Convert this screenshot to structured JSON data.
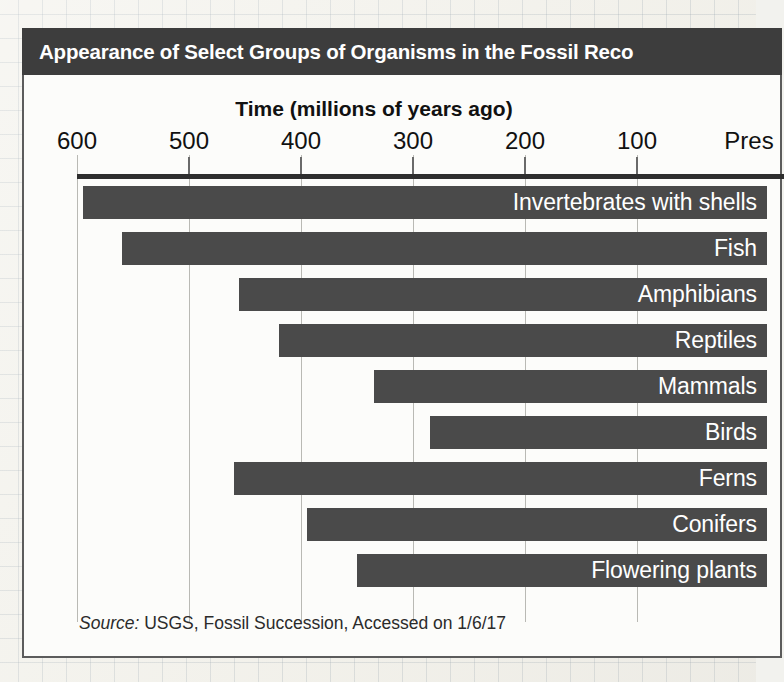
{
  "figure": {
    "title": "Appearance of Select Groups of Organisms in the Fossil Reco",
    "axis_title": "Time (millions of years ago)",
    "source_prefix": "Source:",
    "source_text": " USGS, Fossil Succession, Accessed on 1/6/17",
    "colors": {
      "title_bar": "#3d3d3d",
      "bar_fill": "#4a4a4a",
      "panel_bg": "#fcfcfa",
      "gridline": "#b9b9b4",
      "axis_line": "#2e2e2e",
      "label_text": "#ffffff"
    }
  },
  "chart_data": {
    "type": "bar",
    "orientation": "horizontal",
    "title": "Appearance of Select Groups of Organisms in the Fossil Reco",
    "xlabel": "Time (millions of years ago)",
    "ylabel": "",
    "xlim": [
      600,
      0
    ],
    "x_tick_labels": [
      "600",
      "500",
      "400",
      "300",
      "200",
      "100",
      "Pres"
    ],
    "x_ticks": [
      600,
      500,
      400,
      300,
      200,
      100,
      0
    ],
    "x_axis_reversed": true,
    "grid": true,
    "legend": "none",
    "units": "millions of years ago",
    "note": "Each bar spans from the group's first appearance in the fossil record to the present day.",
    "categories": [
      "Invertebrates with shells",
      "Fish",
      "Amphibians",
      "Reptiles",
      "Mammals",
      "Birds",
      "Ferns",
      "Conifers",
      "Flowering plants"
    ],
    "values": [
      595,
      560,
      455,
      420,
      335,
      285,
      460,
      395,
      350
    ],
    "bars": [
      {
        "label": "Invertebrates with shells",
        "start_mya": 595,
        "end_mya": 0
      },
      {
        "label": "Fish",
        "start_mya": 560,
        "end_mya": 0
      },
      {
        "label": "Amphibians",
        "start_mya": 455,
        "end_mya": 0
      },
      {
        "label": "Reptiles",
        "start_mya": 420,
        "end_mya": 0
      },
      {
        "label": "Mammals",
        "start_mya": 335,
        "end_mya": 0
      },
      {
        "label": "Birds",
        "start_mya": 285,
        "end_mya": 0
      },
      {
        "label": "Ferns",
        "start_mya": 460,
        "end_mya": 0
      },
      {
        "label": "Conifers",
        "start_mya": 395,
        "end_mya": 0
      },
      {
        "label": "Flowering plants",
        "start_mya": 350,
        "end_mya": 0
      }
    ]
  }
}
